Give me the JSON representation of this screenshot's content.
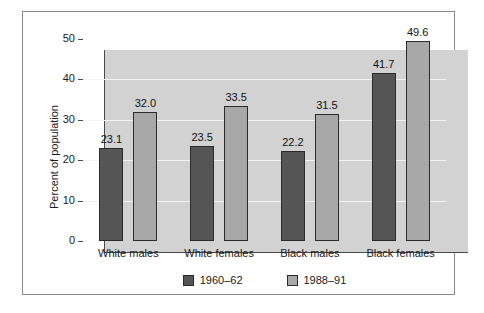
{
  "chart_data": {
    "type": "bar",
    "title": "",
    "subtitle": "",
    "xlabel": "",
    "ylabel": "Percent of population",
    "ylim": [
      0,
      50
    ],
    "yticks": [
      0,
      10,
      20,
      30,
      40,
      50
    ],
    "ytick_labels": [
      "0",
      "10",
      "20",
      "30",
      "40",
      "50"
    ],
    "grid": "horizontal",
    "legend_position": "bottom-center",
    "categories": [
      "White males",
      "White females",
      "Black males",
      "Black females"
    ],
    "series": [
      {
        "name": "1960–62",
        "color": "#555555",
        "values": [
          23.1,
          23.5,
          22.2,
          41.7
        ],
        "value_labels": [
          "23.1",
          "23.5",
          "22.2",
          "41.7"
        ]
      },
      {
        "name": "1988–91",
        "color": "#a8a8a8",
        "values": [
          32.0,
          33.5,
          31.5,
          49.6
        ],
        "value_labels": [
          "32.0",
          "33.5",
          "31.5",
          "49.6"
        ]
      }
    ],
    "plot_background": "#d2d2d2",
    "gridline_color": "#f2f2f2",
    "axis_color": "#4a4a4a",
    "figure_background": "#ffffff"
  }
}
